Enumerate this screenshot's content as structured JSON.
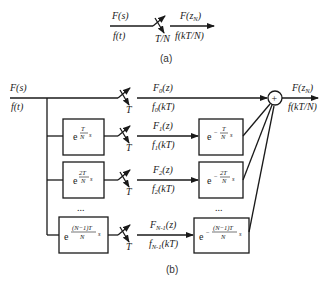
{
  "diagram_a": {
    "input_freq": "F(s)",
    "input_time": "f(t)",
    "switch_label": "T/N",
    "output_freq": "F(z",
    "output_freq_sub": "N",
    "output_freq_close": ")",
    "output_time": "f(kT/N)",
    "caption": "(a)"
  },
  "diagram_b": {
    "input_freq": "F(s)",
    "input_time": "f(t)",
    "switch_label": "T",
    "output_freq": "F(z",
    "output_freq_sub": "N",
    "output_freq_close": ")",
    "output_time": "f(kT/N)",
    "sum_symbol": "+",
    "ellipsis": "...",
    "caption": "(b)",
    "rows": [
      {
        "freq": "F",
        "sub": "0",
        "freq_arg": "(z)",
        "time": "f",
        "time_sub": "0",
        "time_arg": "(kT)"
      },
      {
        "freq": "F",
        "sub": "1",
        "freq_arg": "(z)",
        "time": "f",
        "time_sub": "1",
        "time_arg": "(kT)",
        "advance_num": "T",
        "advance_den": "N",
        "delay_num": "T",
        "delay_den": "N"
      },
      {
        "freq": "F",
        "sub": "2",
        "freq_arg": "(z)",
        "time": "f",
        "time_sub": "2",
        "time_arg": "(kT)",
        "advance_num": "2T",
        "advance_den": "N",
        "delay_num": "2T",
        "delay_den": "N"
      },
      {
        "freq": "F",
        "sub": "N-1",
        "freq_arg": "(z)",
        "time": "f",
        "time_sub": "N-1",
        "time_arg": "(kT)",
        "advance_num": "(N−1)T",
        "advance_den": "N",
        "delay_num": "(N−1)T",
        "delay_den": "N"
      }
    ],
    "exp_base": "e",
    "exp_neg": "−",
    "exp_var": "s"
  }
}
